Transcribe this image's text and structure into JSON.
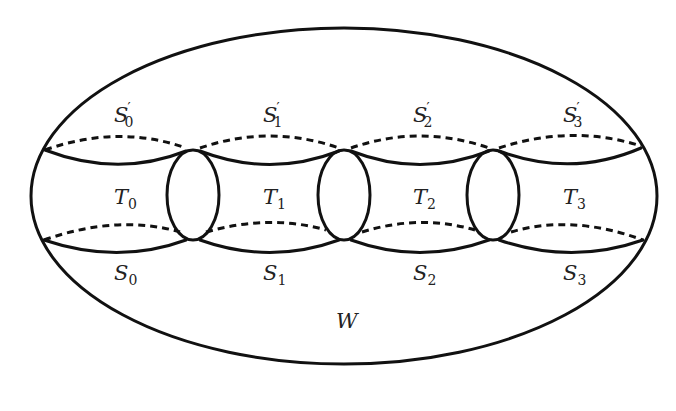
{
  "diagram": {
    "colors": {
      "stroke": "#111111",
      "text": "#222222",
      "background": "#ffffff"
    },
    "outer_region": {
      "label": "W",
      "label_main": "W",
      "label_sub": ""
    },
    "tubes": [
      {
        "label_main": "T",
        "label_sub": "0"
      },
      {
        "label_main": "T",
        "label_sub": "1"
      },
      {
        "label_main": "T",
        "label_sub": "2"
      },
      {
        "label_main": "T",
        "label_sub": "3"
      }
    ],
    "top_boundaries": [
      {
        "label_main": "S",
        "label_prime": "′",
        "label_sub": "0"
      },
      {
        "label_main": "S",
        "label_prime": "′",
        "label_sub": "1"
      },
      {
        "label_main": "S",
        "label_prime": "′",
        "label_sub": "2"
      },
      {
        "label_main": "S",
        "label_prime": "′",
        "label_sub": "3"
      }
    ],
    "bottom_boundaries": [
      {
        "label_main": "S",
        "label_sub": "0"
      },
      {
        "label_main": "S",
        "label_sub": "1"
      },
      {
        "label_main": "S",
        "label_sub": "2"
      },
      {
        "label_main": "S",
        "label_sub": "3"
      }
    ],
    "junction_count": 3
  }
}
